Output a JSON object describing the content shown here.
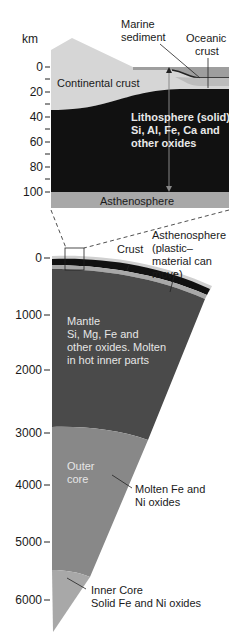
{
  "top_section": {
    "unit_label": "km",
    "ticks": [
      "0",
      "20",
      "40",
      "60",
      "80",
      "100"
    ],
    "labels": {
      "marine_sediment_1": "Marine",
      "marine_sediment_2": "sediment",
      "oceanic_crust_1": "Oceanic",
      "oceanic_crust_2": "crust",
      "continental_crust": "Continental crust",
      "lithosphere_1": "Lithosphere (solid)",
      "lithosphere_2": "Si, Al, Fe, Ca and",
      "lithosphere_3": "other oxides",
      "asthenosphere": "Asthenosphere"
    }
  },
  "bottom_section": {
    "ticks": [
      "0",
      "1000",
      "2000",
      "3000",
      "4000",
      "5000",
      "6000"
    ],
    "labels": {
      "crust": "Crust",
      "asthenosphere_1": "Asthenosphere",
      "asthenosphere_2": "(plastic–",
      "asthenosphere_3": "material can",
      "asthenosphere_4": "move)",
      "mantle_1": "Mantle",
      "mantle_2": "Si, Mg, Fe and",
      "mantle_3": "other oxides. Molten",
      "mantle_4": "in hot inner parts",
      "outer_core_1": "Outer",
      "outer_core_2": "core",
      "outer_core_note_1": "Molten Fe and",
      "outer_core_note_2": "Ni oxides",
      "inner_core_1": "Inner Core",
      "inner_core_2": "Solid Fe and Ni oxides"
    }
  },
  "colors": {
    "continental_crust": "#d4d4d4",
    "ocean_layer": "#9a9a9a",
    "lithosphere": "#111111",
    "asthenosphere": "#a8a8a8",
    "mantle": "#4a4a4a",
    "outer_core": "#888888",
    "inner_core": "#a6a6a6"
  }
}
